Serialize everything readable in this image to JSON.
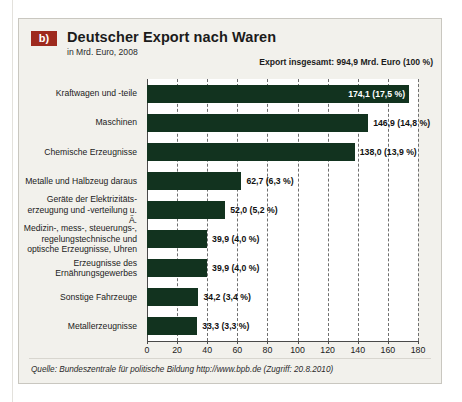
{
  "figure": {
    "badge": "b)",
    "title": "Deutscher Export nach Waren",
    "subtitle": "in Mrd. Euro, 2008",
    "total_note": "Export insgesamt: 994,9 Mrd. Euro (100 %)",
    "source": "Quelle: Bundeszentrale für politische Bildung http://www.bpb.de (Zugriff: 20.8.2010)"
  },
  "colors": {
    "bar": "#12331f",
    "badge": "#9e2a1e",
    "panel_background": "#f2f1ec",
    "plot_background": "#ffffff",
    "grid": "#6f6f6f",
    "text": "#1b1b1b"
  },
  "chart_data": {
    "type": "bar",
    "orientation": "horizontal",
    "title": "Deutscher Export nach Waren",
    "subtitle": "in Mrd. Euro, 2008",
    "xlabel": "",
    "ylabel": "",
    "xlim": [
      0,
      180
    ],
    "xticks": [
      0,
      20,
      40,
      60,
      80,
      100,
      120,
      140,
      160,
      180
    ],
    "xtick_labels": [
      "0",
      "20",
      "40",
      "60",
      "80",
      "100",
      "120",
      "140",
      "160",
      "180"
    ],
    "grid": true,
    "legend": false,
    "annotation": "Export insgesamt: 994,9 Mrd. Euro (100 %)",
    "total_value": 994.9,
    "unit": "Mrd. Euro",
    "year": 2008,
    "categories": [
      "Kraftwagen und -teile",
      "Maschinen",
      "Chemische Erzeugnisse",
      "Metalle und Halbzeug daraus",
      "Geräte der Elektrizitäts-\nerzeugung und -verteilung u. Ä.",
      "Medizin-, mess-, steuerungs-,\nregelungstechnische und\noptische Erzeugnisse, Uhren",
      "Erzeugnisse des\nErnährungsgewerbes",
      "Sonstige Fahrzeuge",
      "Metallerzeugnisse"
    ],
    "values": [
      174.1,
      146.9,
      138.0,
      62.7,
      52.0,
      39.9,
      39.9,
      34.2,
      33.3
    ],
    "shares_percent": [
      17.5,
      14.8,
      13.9,
      6.3,
      5.2,
      4.0,
      4.0,
      3.4,
      3.3
    ],
    "data_labels": [
      "174,1 (17,5 %)",
      "146,9 (14,8 %)",
      "138,0 (13,9 %)",
      "62,7 (6,3 %)",
      "52,0 (5,2 %)",
      "39,9 (4,0 %)",
      "39,9 (4,0 %)",
      "34,2 (3,4 %)",
      "33,3 (3,3 %)"
    ],
    "label_placement": [
      "inside",
      "outside",
      "outside",
      "outside",
      "outside",
      "outside",
      "outside",
      "outside",
      "outside"
    ]
  }
}
